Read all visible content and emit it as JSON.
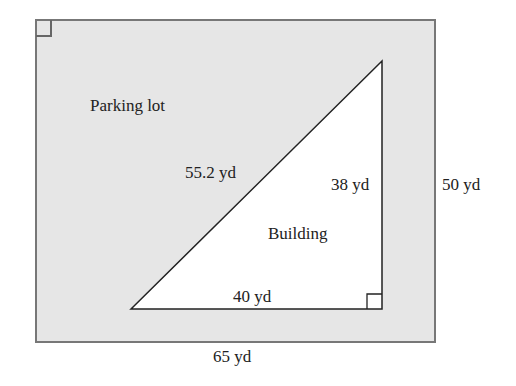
{
  "diagram": {
    "type": "geometry-figure",
    "parking_lot": {
      "label": "Parking lot",
      "width_label": "65 yd",
      "height_label": "50 yd",
      "fill_color": "#e6e6e6",
      "border_color": "#777777",
      "shape": "rectangle",
      "right_angle_marker": "top-left"
    },
    "building": {
      "label": "Building",
      "shape": "right-triangle",
      "hypotenuse_label": "55.2 yd",
      "vertical_leg_label": "38 yd",
      "horizontal_leg_label": "40 yd",
      "fill_color": "#ffffff",
      "stroke_color": "#222222",
      "right_angle_marker": "bottom-right"
    }
  }
}
